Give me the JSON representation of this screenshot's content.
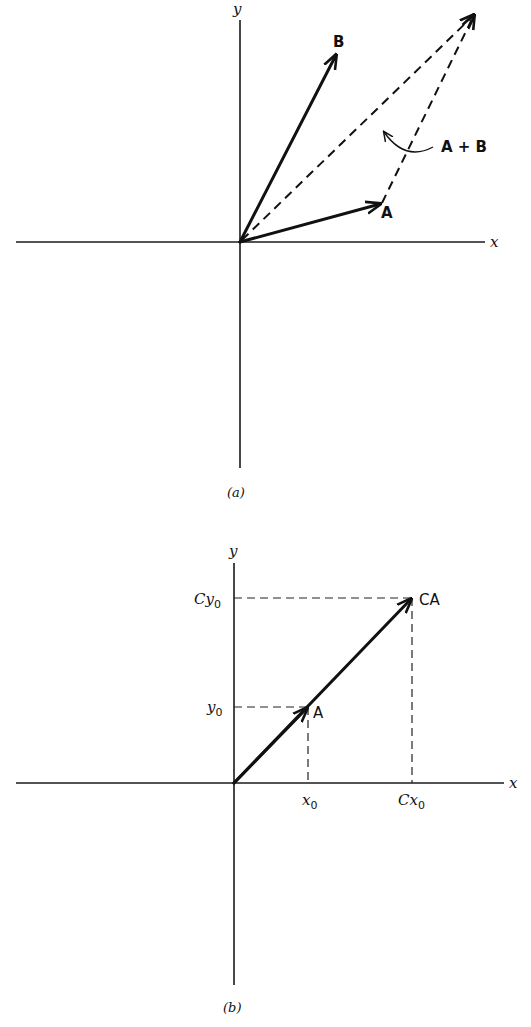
{
  "figure_a": {
    "caption": "(a)",
    "x_axis_label": "x",
    "y_axis_label": "y",
    "vector_a_label": "A",
    "vector_b_label": "B",
    "sum_label": "A + B"
  },
  "figure_b": {
    "caption": "(b)",
    "x_axis_label": "x",
    "y_axis_label": "y",
    "vector_a_label": "A",
    "vector_ca_label": "CA",
    "x_ticks": {
      "x0": "x",
      "x0_sub": "0",
      "cx0": "Cx",
      "cx0_sub": "0"
    },
    "y_ticks": {
      "y0": "y",
      "y0_sub": "0",
      "cy0": "Cy",
      "cy0_sub": "0"
    }
  },
  "colors": {
    "ink": "#111111",
    "background": "#ffffff"
  }
}
